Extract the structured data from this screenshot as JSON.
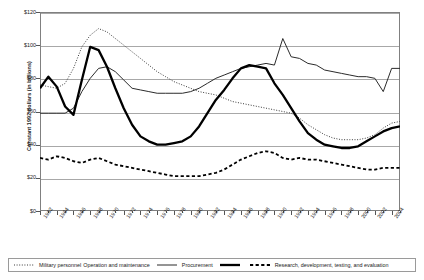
{
  "chart_data": {
    "type": "line",
    "title": "",
    "xlabel": "",
    "ylabel": "Constant 1992 dollars (in billions)",
    "ylim": [
      0,
      120
    ],
    "xlim": [
      1962,
      2005
    ],
    "ytick_labels": [
      "$0",
      "$20",
      "$40",
      "$60",
      "$80",
      "$100",
      "$120"
    ],
    "ytick_values": [
      0,
      20,
      40,
      60,
      80,
      100,
      120
    ],
    "grid": true,
    "legend_position": "bottom",
    "x": [
      1962,
      1963,
      1964,
      1965,
      1966,
      1967,
      1968,
      1969,
      1970,
      1971,
      1972,
      1973,
      1974,
      1975,
      1976,
      1977,
      1978,
      1979,
      1980,
      1981,
      1982,
      1983,
      1984,
      1985,
      1986,
      1987,
      1988,
      1989,
      1990,
      1991,
      1992,
      1993,
      1994,
      1995,
      1996,
      1997,
      1998,
      1999,
      2000,
      2001,
      2002,
      2003,
      2004,
      2005
    ],
    "xtick_labels": [
      "1962",
      "1964",
      "1966",
      "1968",
      "1970",
      "1972",
      "1974",
      "1976",
      "1978",
      "1980",
      "1982",
      "1984",
      "1986",
      "1988",
      "1990",
      "1992",
      "1994",
      "1996",
      "1998",
      "2000",
      "2002",
      "2004"
    ],
    "series": [
      {
        "name": "Military personnel",
        "style": "fine-dotted",
        "color": "#3a3a3a",
        "width": 1.0,
        "dash": "1,1.6",
        "values": [
          76,
          75,
          74,
          77,
          86,
          99,
          106,
          110,
          108,
          104,
          100,
          96,
          92,
          88,
          84,
          81,
          78,
          76,
          74,
          72,
          71,
          70,
          68,
          66,
          65,
          64,
          63,
          62,
          61,
          60,
          59,
          56,
          52,
          49,
          46,
          44,
          43,
          43,
          43,
          44,
          46,
          50,
          53,
          54
        ]
      },
      {
        "name": "Operation and maintenance",
        "style": "thin-solid",
        "color": "#2b2b2b",
        "width": 1.0,
        "dash": "",
        "values": [
          59,
          59,
          59,
          59,
          62,
          72,
          80,
          86,
          87,
          84,
          79,
          74,
          73,
          72,
          71,
          71,
          71,
          71,
          72,
          74,
          77,
          80,
          82,
          84,
          86,
          87,
          88,
          89,
          88,
          104,
          93,
          92,
          89,
          88,
          85,
          84,
          83,
          82,
          81,
          81,
          80,
          72,
          86,
          86
        ]
      },
      {
        "name": "Procurement",
        "style": "thick-solid",
        "color": "#000000",
        "width": 2.3,
        "dash": "",
        "values": [
          74,
          81,
          75,
          63,
          58,
          79,
          99,
          97,
          87,
          74,
          62,
          52,
          45,
          42,
          40,
          40,
          41,
          42,
          45,
          51,
          59,
          67,
          73,
          80,
          86,
          88,
          87,
          86,
          77,
          70,
          62,
          54,
          47,
          43,
          40,
          39,
          38,
          38,
          39,
          42,
          45,
          48,
          50,
          51
        ]
      },
      {
        "name": "Research, development, testing, and evaluation",
        "style": "dashed",
        "color": "#000000",
        "width": 1.8,
        "dash": "3.2,2.4",
        "values": [
          32,
          31,
          33,
          32,
          30,
          29,
          31,
          32,
          30,
          28,
          27,
          26,
          25,
          24,
          23,
          22,
          21,
          21,
          21,
          21,
          22,
          23,
          25,
          28,
          31,
          33,
          35,
          36,
          35,
          32,
          31,
          32,
          31,
          31,
          30,
          29,
          28,
          27,
          26,
          25,
          25,
          26,
          26,
          26
        ]
      }
    ]
  },
  "legend": {
    "items": [
      {
        "label": "Military personnel",
        "swatch": "fine-dotted-swatch"
      },
      {
        "label": "Operation and maintenance",
        "swatch": "thin-solid-swatch"
      },
      {
        "label": "Procurement",
        "swatch": "thick-solid-swatch"
      },
      {
        "label": "Research, development, testing, and evaluation",
        "swatch": "dashed-swatch"
      }
    ]
  }
}
